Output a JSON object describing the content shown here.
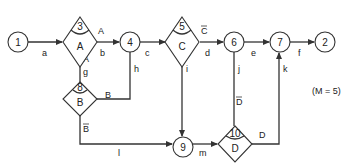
{
  "diagram": {
    "note": "(M = 5)",
    "nodes": {
      "n1": {
        "id": "1",
        "type": "circle"
      },
      "n2": {
        "id": "2",
        "type": "circle"
      },
      "n3": {
        "id": "3",
        "type": "decision",
        "condition": "A"
      },
      "n4": {
        "id": "4",
        "type": "circle"
      },
      "n5": {
        "id": "5",
        "type": "decision",
        "condition": "C"
      },
      "n6": {
        "id": "6",
        "type": "circle"
      },
      "n7": {
        "id": "7",
        "type": "circle"
      },
      "n8": {
        "id": "8",
        "type": "decision",
        "condition": "B"
      },
      "n9": {
        "id": "9",
        "type": "circle"
      },
      "n10": {
        "id": "10",
        "type": "decision",
        "condition": "D"
      }
    },
    "edges": {
      "a": {
        "label": "a",
        "from": "1",
        "to": "3"
      },
      "b": {
        "label": "b",
        "from": "3",
        "to": "4",
        "branch": "A"
      },
      "c": {
        "label": "c",
        "from": "4",
        "to": "5"
      },
      "d": {
        "label": "d",
        "from": "5",
        "to": "6",
        "branch": "C"
      },
      "e": {
        "label": "e",
        "from": "6",
        "to": "7"
      },
      "f": {
        "label": "f",
        "from": "7",
        "to": "2"
      },
      "g": {
        "label": "g",
        "from": "3",
        "to": "8",
        "branch": "A"
      },
      "h": {
        "label": "h",
        "from": "8",
        "to": "4",
        "branch": "B"
      },
      "i": {
        "label": "i",
        "from": "5",
        "to": "9",
        "branch": "C"
      },
      "j": {
        "label": "j",
        "from": "6",
        "to": "10"
      },
      "k": {
        "label": "k",
        "from": "10",
        "to": "7",
        "branch": "D"
      },
      "l": {
        "label": "l",
        "from": "8",
        "to": "9",
        "branch": "B"
      },
      "m": {
        "label": "m",
        "from": "9",
        "to": "10"
      }
    },
    "branch_labels": {
      "A_true": "A",
      "A_false": "A",
      "B_true": "B",
      "B_false": "B",
      "C_true": "C",
      "C_false": "C",
      "D_true": "D",
      "D_false": "D"
    }
  }
}
